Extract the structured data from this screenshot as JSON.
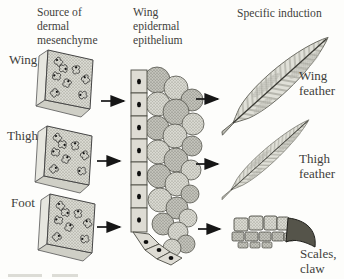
{
  "headers": {
    "source": "Source of\ndermal\nmesenchyme",
    "epithelium": "Wing\nepidermal\nepithelium",
    "induction": "Specific induction"
  },
  "rows": [
    {
      "source": "Wing",
      "result": "Wing\nfeather"
    },
    {
      "source": "Thigh",
      "result": "Thigh\nfeather"
    },
    {
      "source": "Foot",
      "result": "Scales,\nclaw"
    }
  ],
  "colors": {
    "background": "#fdfdfb",
    "ink": "#3f3f3b",
    "line": "#161616",
    "tissue-fill": "#d9d9d1",
    "tissue-stipple": "#7d7d73",
    "outline": "#4c4c44",
    "claw": "#55544a"
  }
}
